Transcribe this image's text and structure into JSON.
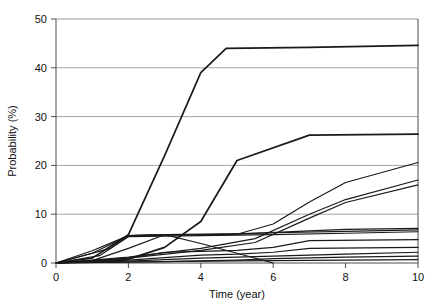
{
  "chart_data": {
    "type": "line",
    "title": "",
    "xlabel": "Time (year)",
    "ylabel": "Probability (%)",
    "xlim": [
      0,
      10
    ],
    "ylim": [
      0,
      50
    ],
    "xticks": [
      0,
      2,
      4,
      6,
      8,
      10
    ],
    "yticks": [
      0,
      10,
      20,
      30,
      40,
      50
    ],
    "grid": "horizontal",
    "legend": "none",
    "line_color": "#1a1a1a",
    "grid_color": "#9a9a9a",
    "axis_color": "#4d4d4d",
    "background": "#ffffff",
    "series": [
      {
        "name": "series-1",
        "x": [
          0,
          1,
          2,
          3,
          4,
          4.7,
          7,
          10
        ],
        "y": [
          0,
          1.0,
          5.8,
          22.0,
          39.0,
          44.0,
          44.2,
          44.6
        ]
      },
      {
        "name": "series-2",
        "x": [
          0,
          2,
          3,
          4,
          5,
          7,
          10
        ],
        "y": [
          0,
          0.8,
          3.2,
          8.5,
          21.0,
          26.2,
          26.4
        ]
      },
      {
        "name": "series-3",
        "x": [
          0,
          1,
          2,
          3,
          5,
          6,
          7,
          8,
          10
        ],
        "y": [
          0,
          0.5,
          3.0,
          5.8,
          5.9,
          8.0,
          12.5,
          16.5,
          20.6
        ]
      },
      {
        "name": "series-4",
        "x": [
          0,
          2,
          4,
          5.5,
          7,
          8,
          10
        ],
        "y": [
          0,
          1.2,
          3.0,
          5.0,
          10.0,
          13.0,
          17.0
        ]
      },
      {
        "name": "series-5",
        "x": [
          0,
          2,
          4,
          5.5,
          7,
          8,
          10
        ],
        "y": [
          0,
          1.0,
          2.6,
          4.2,
          9.2,
          12.4,
          16.0
        ]
      },
      {
        "name": "series-6",
        "x": [
          0,
          1,
          2,
          3,
          5,
          7,
          8,
          10
        ],
        "y": [
          0,
          2.0,
          5.6,
          5.8,
          5.9,
          6.6,
          6.9,
          7.1
        ]
      },
      {
        "name": "series-7",
        "x": [
          0,
          1.5,
          2,
          4,
          6,
          8,
          10
        ],
        "y": [
          0,
          3.0,
          5.6,
          5.8,
          6.2,
          6.5,
          6.8
        ]
      },
      {
        "name": "series-8",
        "x": [
          0,
          1.2,
          2,
          4,
          6,
          8,
          10
        ],
        "y": [
          0,
          1.5,
          5.4,
          5.6,
          5.8,
          6.1,
          6.4
        ]
      },
      {
        "name": "series-9",
        "x": [
          0,
          2,
          3,
          4,
          5,
          6,
          7,
          10
        ],
        "y": [
          0,
          1.0,
          2.2,
          2.4,
          2.6,
          3.2,
          4.6,
          4.8
        ]
      },
      {
        "name": "series-10",
        "x": [
          0,
          2,
          4,
          5,
          6,
          7,
          10
        ],
        "y": [
          0,
          0.6,
          1.6,
          1.8,
          2.2,
          3.0,
          3.2
        ]
      },
      {
        "name": "series-11",
        "x": [
          0,
          2,
          4,
          6,
          8,
          10
        ],
        "y": [
          0,
          0.4,
          1.0,
          1.4,
          1.8,
          2.2
        ]
      },
      {
        "name": "series-12",
        "x": [
          0,
          3,
          5,
          6,
          8,
          10
        ],
        "y": [
          0,
          0.3,
          0.6,
          0.9,
          1.2,
          1.4
        ]
      },
      {
        "name": "series-13",
        "x": [
          0,
          2,
          4,
          6,
          8,
          10
        ],
        "y": [
          0,
          0.2,
          0.4,
          0.5,
          0.6,
          0.7
        ]
      },
      {
        "name": "series-14",
        "x": [
          0,
          1,
          2,
          3,
          4,
          5,
          6
        ],
        "y": [
          0,
          2.5,
          5.6,
          5.8,
          4.0,
          2.0,
          0.0
        ]
      }
    ]
  }
}
